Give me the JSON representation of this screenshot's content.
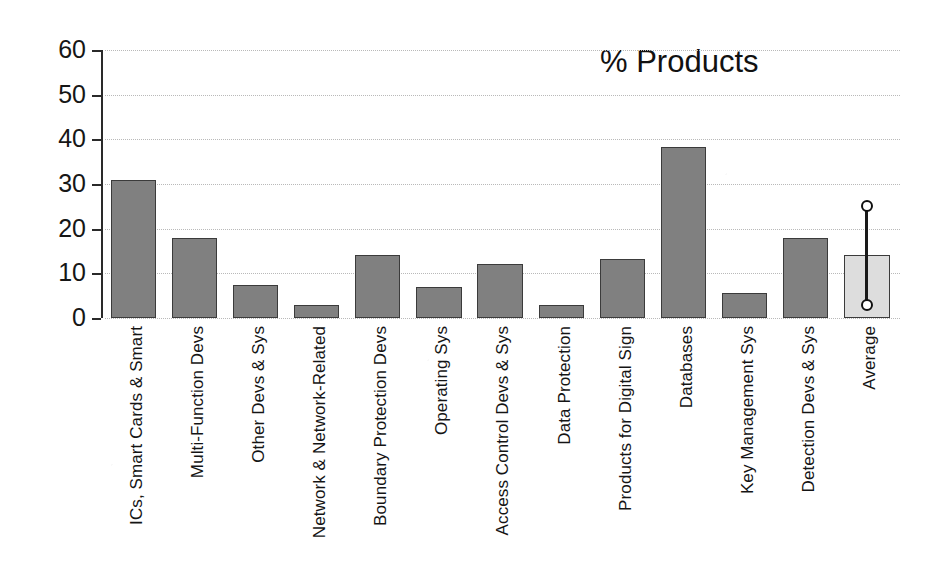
{
  "chart_data": {
    "type": "bar",
    "title": "% Products",
    "xlabel": "",
    "ylabel": "",
    "ylim": [
      0,
      60
    ],
    "yticks": [
      0,
      10,
      20,
      30,
      40,
      50,
      60
    ],
    "grid": true,
    "legend": "none",
    "categories": [
      "ICs, Smart Cards & Smart",
      "Multi-Function Devs",
      "Other Devs & Sys",
      "Network & Network-Related",
      "Boundary Protection Devs",
      "Operating Sys",
      "Access Control Devs & Sys",
      "Data Protection",
      "Products for Digital Sign",
      "Databases",
      "Key Management Sys",
      "Detection Devs & Sys",
      "Average"
    ],
    "values": [
      31,
      18,
      7.3,
      3,
      14,
      7,
      12,
      3,
      13.3,
      38.2,
      5.6,
      18,
      14.1
    ],
    "annotations": {
      "average_error_bar": {
        "category": "Average",
        "upper": 25,
        "lower": 3,
        "marker": "circle"
      }
    },
    "colors": {
      "bar_fill": "#808080",
      "bar_edge": "#3b3b3b",
      "average_fill": "#dddddd",
      "grid": "#b9b9b9",
      "axis": "#2a2a2a",
      "text": "#141414"
    }
  }
}
